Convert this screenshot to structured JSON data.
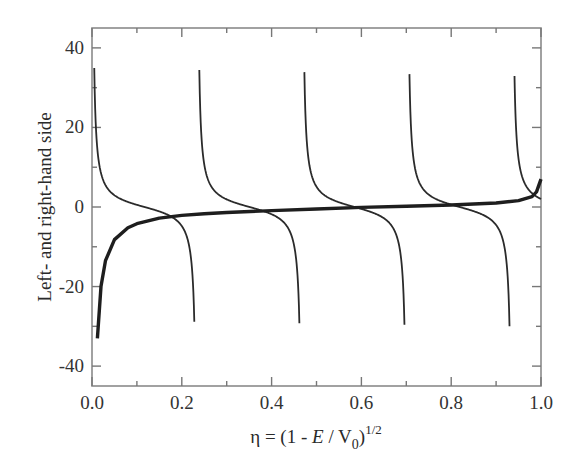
{
  "chart_data": {
    "type": "line",
    "title": "",
    "xlabel": "η = (1 - E / V0)^1/2",
    "xlabel_parts": {
      "main": "η = (1 - ",
      "E": "E",
      "slash": " / V",
      "sub": "0",
      "close": ")",
      "sup": "1/2"
    },
    "ylabel": "Left- and right-hand side",
    "xlim": [
      0.0,
      1.0
    ],
    "ylim": [
      -45,
      45
    ],
    "x_ticks": [
      0.0,
      0.2,
      0.4,
      0.6,
      0.8,
      1.0
    ],
    "x_tick_labels": [
      "0.0",
      "0.2",
      "0.4",
      "0.6",
      "0.8",
      "1.0"
    ],
    "x_minor_ticks": [
      0.1,
      0.3,
      0.5,
      0.7,
      0.9
    ],
    "y_ticks": [
      -40,
      -20,
      0,
      20,
      40
    ],
    "y_tick_labels": [
      "-40",
      "-20",
      "0",
      "20",
      "40"
    ],
    "y_minor_ticks": [
      -30,
      -10,
      10,
      30
    ],
    "grid": false,
    "legend": null,
    "series": [
      {
        "name": "cot branches (thin)",
        "style": "thin",
        "function": "A*cot(alpha*eta)",
        "A": 2.35,
        "alpha": 13.43,
        "clip": [
          -33,
          35
        ],
        "branches": [
          {
            "x_start": 0.005,
            "x_end": 0.232
          },
          {
            "x_start": 0.239,
            "x_end": 0.466
          },
          {
            "x_start": 0.473,
            "x_end": 0.7
          },
          {
            "x_start": 0.707,
            "x_end": 0.934
          },
          {
            "x_start": 0.941,
            "x_end": 1.0
          }
        ]
      },
      {
        "name": "thick curve",
        "style": "thick",
        "x": [
          0.012,
          0.02,
          0.03,
          0.05,
          0.08,
          0.1,
          0.15,
          0.2,
          0.25,
          0.3,
          0.4,
          0.5,
          0.6,
          0.7,
          0.8,
          0.9,
          0.95,
          0.98,
          0.99,
          1.0
        ],
        "y": [
          -33,
          -20,
          -13.5,
          -8.2,
          -5.2,
          -4.2,
          -2.8,
          -2.1,
          -1.7,
          -1.4,
          -0.9,
          -0.5,
          -0.1,
          0.2,
          0.5,
          1.0,
          1.6,
          2.6,
          3.8,
          7.0
        ]
      }
    ]
  }
}
